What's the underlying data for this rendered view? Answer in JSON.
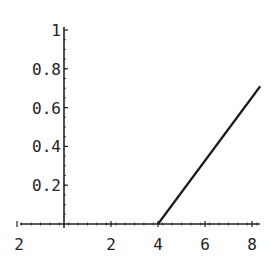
{
  "chart_data": {
    "type": "line",
    "title": "",
    "xlabel": "",
    "ylabel": "",
    "xlim": [
      -2.2,
      8.4
    ],
    "ylim": [
      0,
      1.0
    ],
    "grid": false,
    "legend": null,
    "x_ticks": [
      "-2",
      "2",
      "4",
      "6",
      "8"
    ],
    "x_tick_values": [
      -2,
      2,
      4,
      6,
      8
    ],
    "y_ticks": [
      "0.2",
      "0.4",
      "0.6",
      "0.8",
      "1"
    ],
    "y_tick_values": [
      0.2,
      0.4,
      0.6,
      0.8,
      1.0
    ],
    "series": [
      {
        "name": "f(x)",
        "x": [
          4,
          8.35
        ],
        "y": [
          0,
          0.71
        ],
        "color": "#1a1a1a"
      }
    ]
  },
  "colors": {
    "axis": "#222222",
    "line": "#1a1a1a",
    "background": "#ffffff"
  }
}
